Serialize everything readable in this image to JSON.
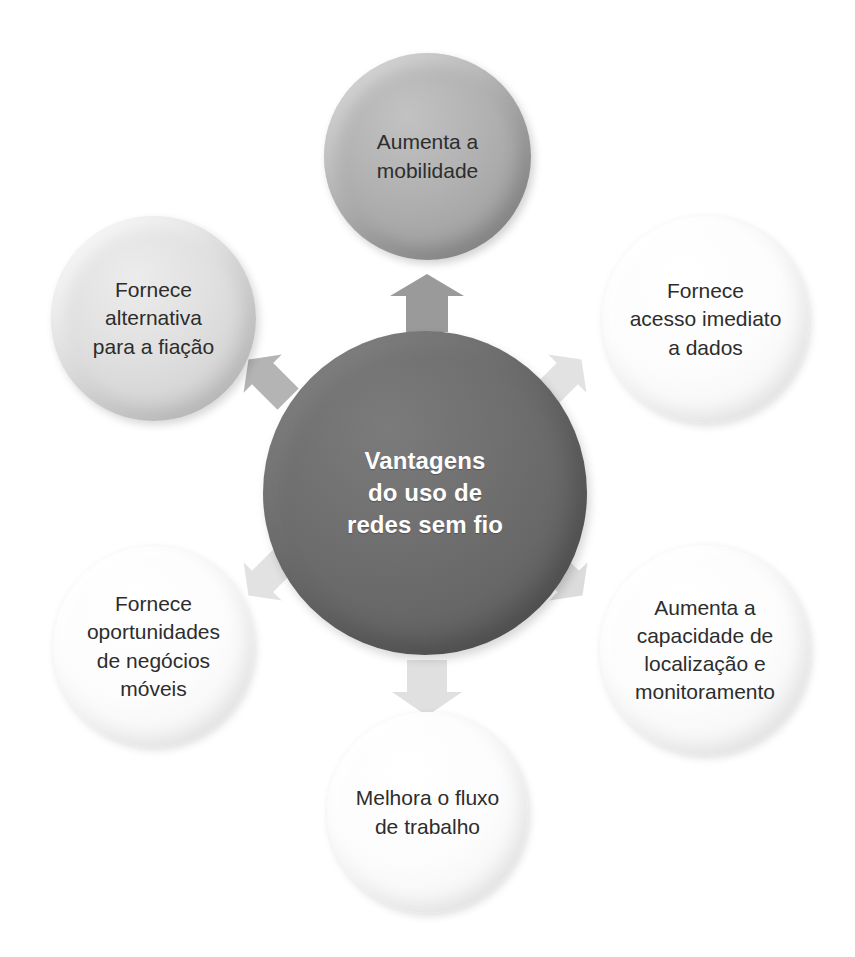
{
  "diagram": {
    "title": "Vantagens do uso de redes sem fio",
    "type": "hub-and-spoke",
    "center": {
      "id": "center-hub",
      "text": "Vantagens\ndo uso de\nredes sem fio",
      "fill": "#6b6b6b",
      "text_color": "#ffffff"
    },
    "nodes": [
      {
        "id": "aumenta-mobilidade",
        "position": "top",
        "text": "Aumenta a\nmobilidade",
        "fill": "#a8a8a8",
        "text_color": "#2d2d2d"
      },
      {
        "id": "fornece-alternativa-fiacao",
        "position": "upper-left",
        "text": "Fornece\nalternativa\npara a fiação",
        "fill": "#d8d8d8",
        "text_color": "#2d2d2d"
      },
      {
        "id": "fornece-acesso-imediato",
        "position": "upper-right",
        "text": "Fornece\nacesso imediato\na dados",
        "fill": "#fbfbfb",
        "text_color": "#2d2d2d"
      },
      {
        "id": "fornece-oportunidades-negocios",
        "position": "lower-left",
        "text": "Fornece\noportunidades\nde negócios\nmóveis",
        "fill": "#fbfbfb",
        "text_color": "#2d2d2d"
      },
      {
        "id": "aumenta-capacidade-localizacao",
        "position": "lower-right",
        "text": "Aumenta a\ncapacidade de\nlocalização e\nmonitoramento",
        "fill": "#fbfbfb",
        "text_color": "#2d2d2d"
      },
      {
        "id": "melhora-fluxo-trabalho",
        "position": "bottom",
        "text": "Melhora o fluxo\nde trabalho",
        "fill": "#fbfbfb",
        "text_color": "#2d2d2d"
      }
    ],
    "connectors": [
      {
        "id": "arrow-up",
        "direction": "up",
        "fill": "#9a9a9a"
      },
      {
        "id": "arrow-ul",
        "direction": "upper-left",
        "fill": "#b4b4b4"
      },
      {
        "id": "arrow-ur",
        "direction": "upper-right",
        "fill": "#e2e2e2"
      },
      {
        "id": "arrow-ll",
        "direction": "lower-left",
        "fill": "#e2e2e2"
      },
      {
        "id": "arrow-lr",
        "direction": "lower-right",
        "fill": "#dcdcdc"
      },
      {
        "id": "arrow-down",
        "direction": "down",
        "fill": "#e0e0e0"
      }
    ]
  }
}
